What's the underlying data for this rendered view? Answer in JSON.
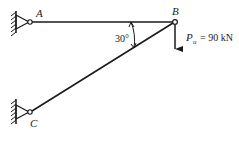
{
  "diagram": {
    "type": "truss-structure",
    "nodes": {
      "A": {
        "label": "A",
        "support": "pin-wall"
      },
      "B": {
        "label": "B",
        "support": "free-joint"
      },
      "C": {
        "label": "C",
        "support": "pin-wall"
      }
    },
    "members": [
      {
        "from": "A",
        "to": "B",
        "orientation": "horizontal"
      },
      {
        "from": "C",
        "to": "B",
        "orientation": "inclined"
      }
    ],
    "angle": {
      "label": "30°",
      "between": [
        "AB",
        "CB"
      ],
      "at": "B"
    },
    "load": {
      "symbol": "P",
      "subscript": "u",
      "equals": "= 90 kN",
      "direction": "down",
      "at": "B"
    },
    "colors": {
      "line": "#1a1a1a",
      "background": "#ffffff"
    }
  }
}
